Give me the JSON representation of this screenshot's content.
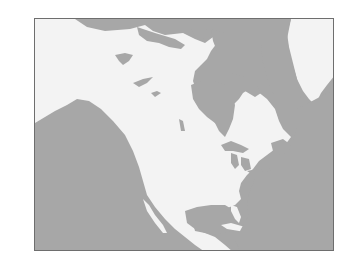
{
  "map": {
    "region": "North America",
    "style": "grayscale outline map, no labels",
    "colors": {
      "ocean": "#a7a7a7",
      "land": "#f3f3f3",
      "frame": "#6e6e6e",
      "background": "#ffffff"
    },
    "features": [
      "Alaska",
      "Canada",
      "Arctic Archipelago",
      "Greenland",
      "Hudson Bay",
      "Great Lakes",
      "United States",
      "Mexico",
      "Gulf of Mexico",
      "Caribbean islands",
      "Central America",
      "Pacific Ocean",
      "Atlantic Ocean"
    ]
  }
}
